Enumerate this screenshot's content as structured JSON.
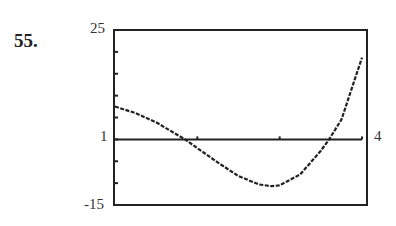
{
  "problem_number": "55.",
  "chart_data": {
    "type": "line",
    "title": "",
    "xlabel": "",
    "ylabel": "",
    "xlim": [
      1,
      4
    ],
    "ylim": [
      -15,
      25
    ],
    "x_axis_at_y": 0,
    "x_ticks": [
      2,
      3,
      4
    ],
    "y_ticks": [
      -15,
      -10,
      -5,
      0,
      5,
      10,
      15,
      20,
      25
    ],
    "labels": {
      "y_max": "25",
      "y_min": "-15",
      "x_min": "1",
      "x_max": "4"
    },
    "grid": false,
    "series": [
      {
        "name": "f(x)",
        "style": "dotted",
        "x": [
          1.0,
          1.25,
          1.5,
          1.75,
          1.85,
          2.0,
          2.25,
          2.5,
          2.75,
          2.9,
          3.0,
          3.25,
          3.5,
          3.6,
          3.75,
          4.0
        ],
        "y": [
          7.5,
          6.0,
          3.9,
          1.1,
          0,
          -2.0,
          -5.3,
          -8.4,
          -10.3,
          -10.7,
          -10.5,
          -8.0,
          -2.6,
          0,
          4.5,
          18.7
        ]
      }
    ]
  }
}
